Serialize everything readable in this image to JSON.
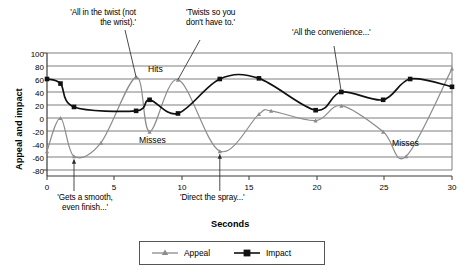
{
  "chart_data": {
    "type": "line",
    "title": "",
    "xlabel": "Seconds",
    "ylabel": "Appeal and impact",
    "xlim": [
      0,
      30
    ],
    "ylim": [
      -80,
      100
    ],
    "xticks": [
      0,
      5,
      10,
      15,
      20,
      25,
      30
    ],
    "yticks": [
      -80,
      -60,
      -40,
      -20,
      0,
      20,
      40,
      60,
      80,
      100
    ],
    "grid": "horizontal",
    "legend_position": "bottom",
    "series": [
      {
        "name": "Appeal",
        "color": "#8c8c8c",
        "marker": "triangle",
        "x": [
          0,
          1,
          2,
          4,
          6.6,
          7.6,
          9.7,
          12.8,
          15.7,
          16.6,
          19.9,
          21.8,
          24.9,
          26.6,
          30
        ],
        "values": [
          -51,
          0,
          -59,
          -38,
          63,
          -21,
          59,
          -51,
          6,
          11,
          -4,
          19,
          -21,
          -59,
          76
        ]
      },
      {
        "name": "Impact",
        "color": "#111111",
        "marker": "square",
        "x": [
          0,
          1,
          2,
          6.6,
          7.6,
          9.7,
          12.8,
          15.7,
          19.9,
          21.8,
          24.9,
          26.9,
          30
        ],
        "values": [
          60,
          53,
          17,
          11,
          28,
          7,
          60,
          61,
          12,
          40,
          28,
          60,
          48
        ]
      }
    ],
    "annotations": [
      {
        "id": "all-in-the-twist",
        "text": "'All in the twist (not\nthe wrist).'",
        "target_x": 6.6,
        "target_y": 63
      },
      {
        "id": "twists-so-you",
        "text": "'Twists so you\ndon't have to.'",
        "target_x": 9.7,
        "target_y": 59
      },
      {
        "id": "all-the-convenience",
        "text": "'All the convenience...'",
        "target_x": 21.8,
        "target_y": 40
      },
      {
        "id": "gets-a-smooth",
        "text": "'Gets a smooth,\neven finish...'",
        "target_x": 2,
        "target_y": -59
      },
      {
        "id": "direct-the-spray",
        "text": "'Direct the spray...'",
        "target_x": 12.8,
        "target_y": -51
      }
    ],
    "plot_labels": [
      {
        "id": "hits",
        "text": "Hits",
        "x": 8.2,
        "y": 76
      },
      {
        "id": "misses-left",
        "text": "Misses",
        "x": 8.4,
        "y": -30
      },
      {
        "id": "misses-right",
        "text": "Misses",
        "x": 26.8,
        "y": -33
      }
    ]
  },
  "legend": {
    "items": [
      {
        "label": "Appeal",
        "color": "#8c8c8c",
        "marker": "triangle"
      },
      {
        "label": "Impact",
        "color": "#111111",
        "marker": "square"
      }
    ]
  },
  "axes": {
    "y_title": "Appeal and impact",
    "x_title": "Seconds",
    "y_tick_labels": [
      "100",
      "80",
      "60",
      "40",
      "20",
      "0",
      "-20",
      "-40",
      "-60",
      "-80"
    ],
    "x_tick_labels": [
      "0",
      "5",
      "10",
      "15",
      "20",
      "25",
      "30"
    ]
  }
}
